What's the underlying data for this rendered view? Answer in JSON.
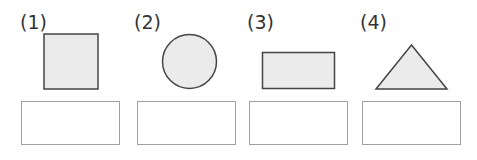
{
  "problems": [
    {
      "label": "(1)",
      "shape": "square",
      "answer": ""
    },
    {
      "label": "(2)",
      "shape": "circle",
      "answer": ""
    },
    {
      "label": "(3)",
      "shape": "rectangle",
      "answer": ""
    },
    {
      "label": "(4)",
      "shape": "triangle",
      "answer": ""
    }
  ],
  "colors": {
    "shape_fill": "#ebebeb",
    "shape_stroke": "#444444",
    "box_border": "#a0a0a0"
  }
}
